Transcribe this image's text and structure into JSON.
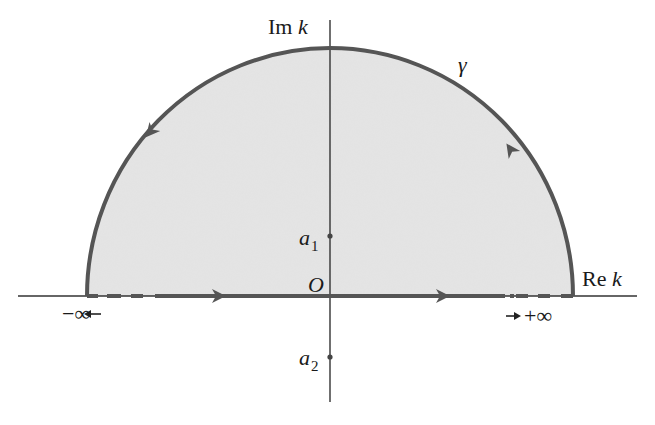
{
  "diagram": {
    "colors": {
      "background": "#ffffff",
      "region_fill": "#e2e2e2",
      "contour_stroke": "#555555",
      "axis_stroke": "#333333",
      "text": "#1a1a1a"
    },
    "axes": {
      "imaginary_label_prefix": "Im",
      "imaginary_label_var": "k",
      "real_label_prefix": "Re",
      "real_label_var": "k",
      "origin_label": "O"
    },
    "contour": {
      "name": "γ",
      "shape": "upper semicircle closed by real-axis segment",
      "orientation": "counterclockwise",
      "arrows": [
        "real axis left → right",
        "arc upper-right going up-left",
        "arc upper-left going down-left"
      ]
    },
    "points": [
      {
        "name": "a",
        "subscript": "1",
        "location": "upper half-plane on imaginary axis (inside contour)"
      },
      {
        "name": "a",
        "subscript": "2",
        "location": "lower half-plane on imaginary axis (outside contour)"
      }
    ],
    "limits": {
      "left": "−∞",
      "left_arrow": "←",
      "right": "+∞",
      "right_arrow": "→"
    }
  }
}
